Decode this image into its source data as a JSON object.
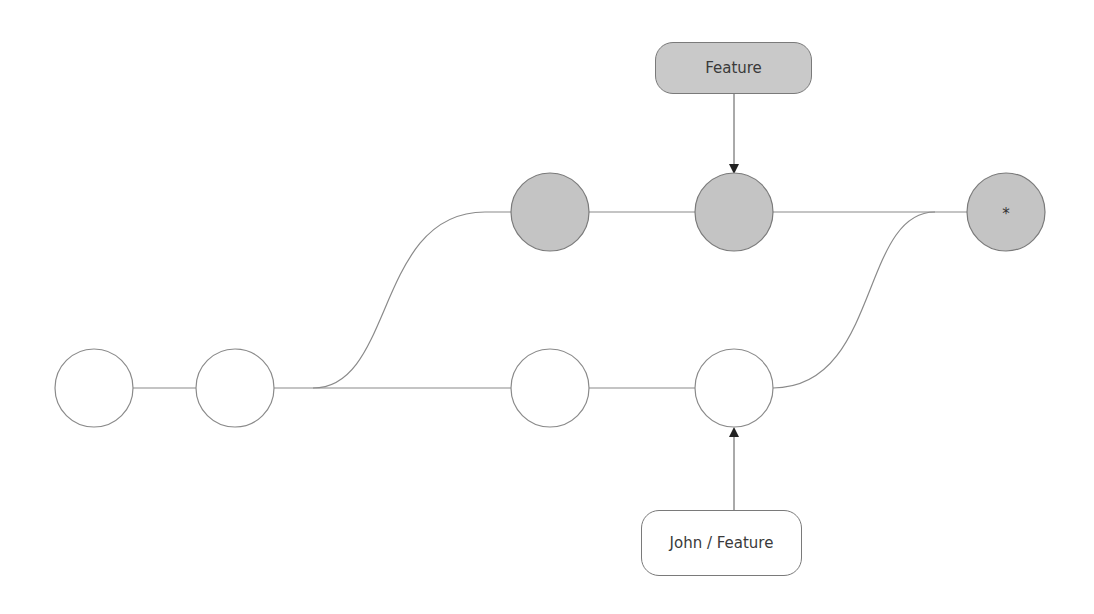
{
  "diagram": {
    "type": "git-branch-graph",
    "colors": {
      "line": "#8a8a8a",
      "node_fill_main": "#ffffff",
      "node_fill_feature": "#c4c4c4",
      "label_feature_fill": "#c9c9c9",
      "label_john_fill": "#ffffff"
    },
    "labels": {
      "feature": "Feature",
      "john_feature": "John / Feature"
    },
    "nodes": [
      {
        "id": "c1",
        "row": "bottom",
        "label": ""
      },
      {
        "id": "c2",
        "row": "bottom",
        "label": ""
      },
      {
        "id": "c3",
        "row": "bottom",
        "label": ""
      },
      {
        "id": "c4",
        "row": "bottom",
        "label": ""
      },
      {
        "id": "f1",
        "row": "top",
        "label": ""
      },
      {
        "id": "f2",
        "row": "top",
        "label": ""
      },
      {
        "id": "m1",
        "row": "top",
        "label": "*"
      }
    ],
    "edges": [
      {
        "from": "c1",
        "to": "c2"
      },
      {
        "from": "c2",
        "to": "c3"
      },
      {
        "from": "c3",
        "to": "c4"
      },
      {
        "from": "c2",
        "to": "f1",
        "curved": true
      },
      {
        "from": "f1",
        "to": "f2"
      },
      {
        "from": "f2",
        "to": "m1"
      },
      {
        "from": "c4",
        "to": "m1",
        "curved": true
      }
    ],
    "pointers": [
      {
        "label": "Feature",
        "points_to": "f2"
      },
      {
        "label": "John / Feature",
        "points_to": "c4"
      }
    ]
  }
}
